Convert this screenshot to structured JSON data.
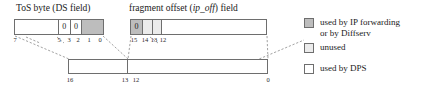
{
  "diagram": {
    "tos_field": {
      "header": "ToS byte (DS field)",
      "cells": [
        {
          "label": "",
          "fill": "white"
        },
        {
          "label": "0",
          "fill": "white"
        },
        {
          "label": "0",
          "fill": "white"
        },
        {
          "label": "",
          "fill": "dark"
        }
      ],
      "ticks": [
        "7",
        "5",
        "3",
        "2",
        "1",
        "0"
      ]
    },
    "frag_field": {
      "header_prefix": "fragment offset (",
      "header_italic": "ip_off",
      "header_suffix": ") field",
      "cells": [
        {
          "label": "0",
          "fill": "dark"
        },
        {
          "label": "",
          "fill": "light"
        },
        {
          "label": "",
          "fill": "light"
        },
        {
          "label": "",
          "fill": "white"
        }
      ],
      "ticks": [
        "15",
        "14",
        "13",
        "12"
      ]
    },
    "bottom_bar": {
      "cells": [
        {
          "label": "",
          "fill": "white"
        },
        {
          "label": "",
          "fill": "white"
        }
      ],
      "ticks": [
        "16",
        "13",
        "12",
        "0"
      ]
    }
  },
  "legend": {
    "items": [
      {
        "swatch": "dark",
        "label": "used by IP forwarding\nor by Diffserv"
      },
      {
        "swatch": "light",
        "label": "unused"
      },
      {
        "swatch": "white",
        "label": "used by DPS"
      }
    ]
  },
  "colors": {
    "dark": "#bdbdbd",
    "light": "#ebebeb",
    "white": "#ffffff",
    "stroke": "#6e6e6e",
    "dashed": "#8a8a8a"
  }
}
